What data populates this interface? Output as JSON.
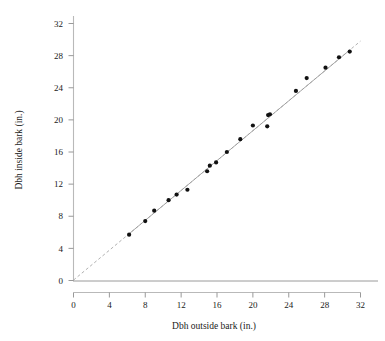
{
  "chart_data": {
    "type": "scatter",
    "title": "",
    "xlabel": "Dbh outside bark (in.)",
    "ylabel": "Dbh inside bark (in.)",
    "xlim": [
      0,
      32
    ],
    "ylim": [
      0,
      32
    ],
    "xticks": [
      0,
      4,
      8,
      12,
      16,
      20,
      24,
      28,
      32
    ],
    "yticks": [
      0,
      4,
      8,
      12,
      16,
      20,
      24,
      28,
      32
    ],
    "xticklabels": [
      "0",
      "4",
      "8",
      "12",
      "16",
      "20",
      "24",
      "28",
      "32"
    ],
    "yticklabels": [
      "0",
      "4",
      "8",
      "12",
      "16",
      "20",
      "24",
      "28",
      "32"
    ],
    "grid": false,
    "legend": null,
    "series": [
      {
        "name": "Trees",
        "marker": "filled-circle",
        "color": "#111111",
        "x": [
          6.2,
          8.0,
          9.0,
          10.6,
          11.5,
          12.7,
          14.9,
          15.2,
          15.9,
          17.1,
          18.6,
          20.0,
          21.6,
          21.7,
          21.9,
          24.8,
          26.0,
          28.1,
          29.6,
          30.8
        ],
        "y": [
          5.7,
          7.4,
          8.7,
          10.0,
          10.7,
          11.3,
          13.6,
          14.3,
          14.7,
          16.0,
          17.6,
          19.3,
          19.2,
          20.6,
          20.7,
          23.6,
          25.2,
          26.5,
          27.8,
          28.5
        ]
      }
    ],
    "fit_line": {
      "name": "regression-line",
      "type": "line",
      "color": "#9d9d9d",
      "slope": 0.93,
      "intercept": 0.05,
      "solid_range": [
        6.2,
        30.8
      ],
      "dashed_range": [
        0,
        32
      ],
      "description": "near-identity fit line, dashed outside the data range"
    }
  },
  "axes": {
    "x_title": "Dbh outside bark (in.)",
    "y_title": "Dbh inside bark (in.)"
  }
}
